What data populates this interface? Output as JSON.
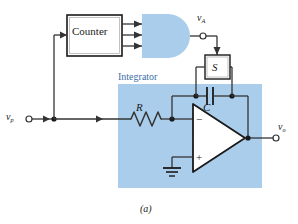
{
  "figure": {
    "caption": "(a)",
    "background_color": "#ffffff",
    "block_fill_color": "#a9cdeb",
    "wire_color": "#333333",
    "integrator_label_color": "#3d6fa5"
  },
  "blocks": {
    "counter": {
      "label": "Counter",
      "shape": "rectangle",
      "fill": "#ffffff",
      "outputs": 3
    },
    "and_gate": {
      "label": "",
      "shape": "and-gate",
      "fill": "#a9cdeb",
      "inputs": 3
    },
    "switch": {
      "label": "S",
      "shape": "rectangle",
      "fill": "#ffffff"
    },
    "integrator": {
      "label": "Integrator",
      "fill": "#a9cdeb"
    },
    "opamp": {
      "inverting_label": "−",
      "noninverting_label": "+",
      "fill": "#ffffff"
    }
  },
  "components": {
    "resistor": {
      "label": "R",
      "type": "resistor"
    },
    "capacitor": {
      "label": "C",
      "type": "capacitor"
    }
  },
  "terminals": {
    "input": {
      "label": "v",
      "subscript": "p"
    },
    "gate_output": {
      "label": "v",
      "subscript": "A"
    },
    "output": {
      "label": "v",
      "subscript": "o"
    }
  },
  "icons": {
    "ground": "ground-icon",
    "junction": "junction-dot-icon",
    "terminal": "open-terminal-icon",
    "arrow": "signal-arrow-icon"
  }
}
